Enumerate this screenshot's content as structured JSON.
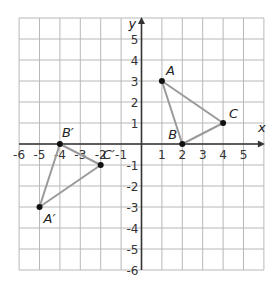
{
  "figure": {
    "type": "coordinate-plane",
    "x_axis_label": "x",
    "y_axis_label": "y",
    "x_range": [
      -6,
      6
    ],
    "y_range": [
      -6,
      6
    ],
    "x_tick_labels": [
      "-6",
      "-5",
      "-4",
      "-3",
      "-2",
      "-1",
      "1",
      "2",
      "3",
      "4",
      "5"
    ],
    "y_tick_labels": [
      "5",
      "4",
      "3",
      "2",
      "1",
      "-1",
      "-2",
      "-3",
      "-4",
      "-5",
      "-6"
    ],
    "grid": true
  },
  "triangles": [
    {
      "name": "ABC",
      "points": [
        {
          "label": "A",
          "x": 1,
          "y": 3
        },
        {
          "label": "B",
          "x": 2,
          "y": 0
        },
        {
          "label": "C",
          "x": 4,
          "y": 1
        }
      ]
    },
    {
      "name": "A'B'C'",
      "points": [
        {
          "label": "A′",
          "x": -5,
          "y": -3
        },
        {
          "label": "B′",
          "x": -4,
          "y": 0
        },
        {
          "label": "C′",
          "x": -2,
          "y": -1
        }
      ]
    }
  ],
  "colors": {
    "grid": "#b8b8b8",
    "axis": "#333333",
    "triangle_edge": "#9a9a9a",
    "point": "#111111"
  }
}
